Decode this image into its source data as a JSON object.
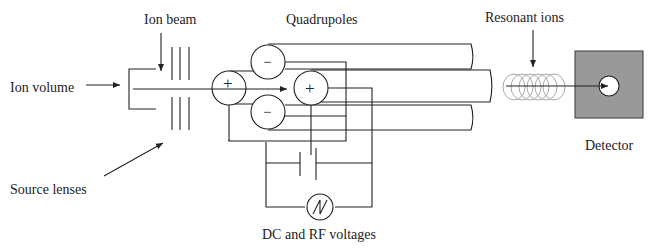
{
  "diagram": {
    "labels": {
      "ion_volume": "Ion volume",
      "ion_beam": "Ion beam",
      "source_lenses": "Source lenses",
      "quadrupoles": "Quadrupoles",
      "resonant_ions": "Resonant ions",
      "detector": "Detector",
      "voltages": "DC and RF voltages"
    },
    "rod_signs": {
      "left": "+",
      "top": "−",
      "bottom": "−",
      "right": "+"
    },
    "colors": {
      "line": "#222222",
      "detector_fill": "#999999",
      "coil": "#aaaaaa"
    }
  }
}
